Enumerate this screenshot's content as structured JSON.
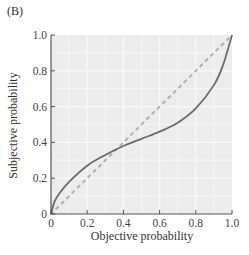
{
  "panel_label": "(B)",
  "chart_data": {
    "type": "line",
    "title": "",
    "xlabel": "Objective probability",
    "ylabel": "Subjective probability",
    "xlim": [
      0,
      1.0
    ],
    "ylim": [
      0,
      1.0
    ],
    "x_ticks": [
      "0",
      "0.2",
      "0.4",
      "0.6",
      "0.8",
      "1.0"
    ],
    "y_ticks": [
      "0",
      "0.2",
      "0.4",
      "0.6",
      "0.8",
      "1.0"
    ],
    "grid": true,
    "legend": null,
    "series": [
      {
        "name": "Subjective probability weighting",
        "style": "solid",
        "color": "#6b6b6b",
        "x": [
          0,
          0.02,
          0.05,
          0.1,
          0.2,
          0.3,
          0.4,
          0.5,
          0.6,
          0.7,
          0.8,
          0.9,
          0.95,
          1.0
        ],
        "y": [
          0,
          0.07,
          0.12,
          0.18,
          0.27,
          0.33,
          0.38,
          0.42,
          0.46,
          0.51,
          0.59,
          0.72,
          0.83,
          1.0
        ]
      },
      {
        "name": "Identity (objective = subjective)",
        "style": "dotted",
        "color": "#b0b0b0",
        "x": [
          0,
          1.0
        ],
        "y": [
          0,
          1.0
        ]
      }
    ]
  },
  "colors": {
    "plot_background": "#ececec",
    "grid": "#f8f8f8",
    "axis": "#555555",
    "curve": "#6b6b6b",
    "diagonal": "#b3b3b3"
  }
}
